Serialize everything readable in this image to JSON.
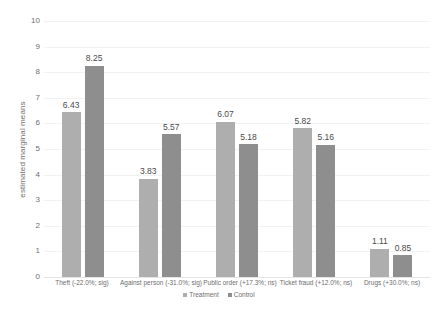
{
  "chart_data": {
    "type": "bar",
    "title": "",
    "xlabel": "",
    "ylabel": "estimated marginal means",
    "ylim": [
      0,
      10
    ],
    "yticks": [
      "10",
      "9",
      "8",
      "7",
      "6",
      "5",
      "4",
      "3",
      "2",
      "1",
      "0"
    ],
    "grid": true,
    "legend_position": "bottom",
    "categories": [
      "Theft (-22.0%; sig)",
      "Against person (-31.0%; sig)",
      "Public order (+17.3%; ns)",
      "Ticket fraud (+12.0%; ns)",
      "Drugs (+30.0%; ns)"
    ],
    "series": [
      {
        "name": "Treatment",
        "color": "#aeaeae",
        "values": [
          6.43,
          3.83,
          6.07,
          5.82,
          1.11
        ],
        "labels": [
          "6.43",
          "3.83",
          "6.07",
          "5.82",
          "1.11"
        ]
      },
      {
        "name": "Control",
        "color": "#8e8e8e",
        "values": [
          8.25,
          5.57,
          5.18,
          5.16,
          0.85
        ],
        "labels": [
          "8.25",
          "5.57",
          "5.18",
          "5.16",
          "0.85"
        ]
      }
    ]
  },
  "legend": {
    "items": [
      {
        "label": "Treatment",
        "color": "#aeaeae"
      },
      {
        "label": "Control",
        "color": "#8e8e8e"
      }
    ]
  },
  "colors": {
    "treatment": "#aeaeae",
    "control": "#8e8e8e",
    "gridline": "#f2f2f2",
    "text": "#6e6e6e",
    "value_text": "#4a4a4a",
    "background": "#ffffff"
  }
}
